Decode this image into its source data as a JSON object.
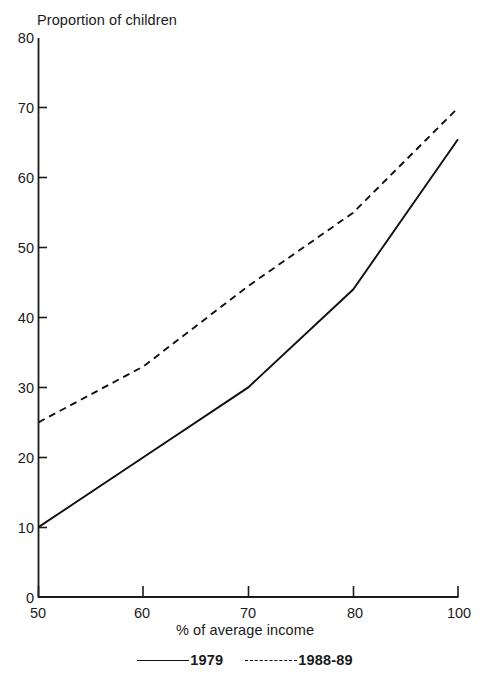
{
  "chart_data": {
    "type": "line",
    "title": "",
    "ylabel": "Proportion of children",
    "xlabel": "% of average income",
    "categories": [
      "50",
      "60",
      "70",
      "80",
      "100"
    ],
    "x_tick_labels": [
      "50",
      "60",
      "70",
      "80",
      "100"
    ],
    "y_tick_labels": [
      "0",
      "10",
      "20",
      "30",
      "40",
      "50",
      "60",
      "70",
      "80"
    ],
    "ylim": [
      0,
      80
    ],
    "y_tick_step": 10,
    "grid": false,
    "legend_position": "bottom-center",
    "series": [
      {
        "name": "1979",
        "style": "solid",
        "color": "#101010",
        "values": [
          10,
          20,
          30,
          44,
          65.5
        ]
      },
      {
        "name": "1988-89",
        "style": "dashed",
        "color": "#101010",
        "values": [
          25,
          33,
          44.5,
          55,
          70
        ]
      }
    ]
  },
  "axes": {
    "y_label_text": "Proportion of children",
    "x_label_text": "% of average income",
    "y_ticks": [
      {
        "label": "80"
      },
      {
        "label": "70"
      },
      {
        "label": "60"
      },
      {
        "label": "50"
      },
      {
        "label": "40"
      },
      {
        "label": "30"
      },
      {
        "label": "20"
      },
      {
        "label": "10"
      },
      {
        "label": "0"
      }
    ],
    "x_ticks": [
      {
        "label": "50"
      },
      {
        "label": "60"
      },
      {
        "label": "70"
      },
      {
        "label": "80"
      },
      {
        "label": "100"
      }
    ]
  },
  "legend": {
    "entries": [
      {
        "label": "1979",
        "style": "solid"
      },
      {
        "label": "1988-89",
        "style": "dashed"
      }
    ]
  }
}
